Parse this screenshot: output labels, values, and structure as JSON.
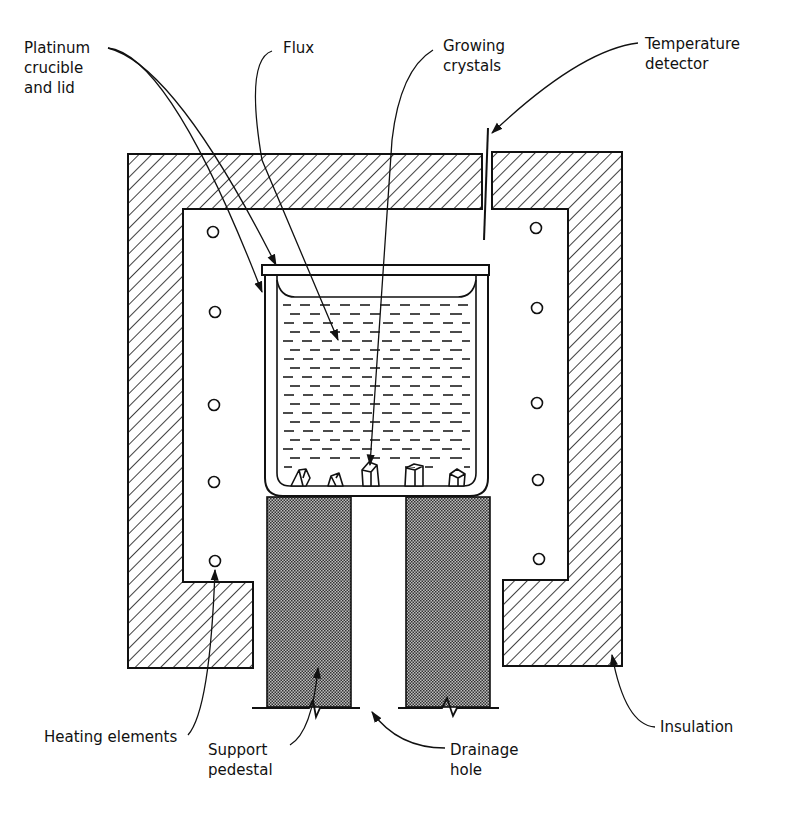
{
  "figure": {
    "type": "schematic",
    "colors": {
      "ink": "#111111",
      "background": "#ffffff",
      "pedestal_fill": "#8a8a8a"
    }
  },
  "labels": {
    "platinum_crucible": "Platinum\ncrucible\nand lid",
    "flux": "Flux",
    "growing_crystals": "Growing\ncrystals",
    "temperature_detector": "Temperature\ndetector",
    "heating_elements": "Heating elements",
    "support_pedestal": "Support\npedestal",
    "drainage_hole": "Drainage\nhole",
    "insulation": "Insulation"
  },
  "components": [
    {
      "id": "insulation",
      "pattern": "diagonal-hatch"
    },
    {
      "id": "platinum-crucible-and-lid"
    },
    {
      "id": "flux",
      "pattern": "dashes"
    },
    {
      "id": "growing-crystals",
      "count": 5
    },
    {
      "id": "temperature-detector"
    },
    {
      "id": "heating-elements",
      "count": 10
    },
    {
      "id": "support-pedestal",
      "count": 2,
      "pattern": "stipple"
    },
    {
      "id": "drainage-hole"
    }
  ]
}
